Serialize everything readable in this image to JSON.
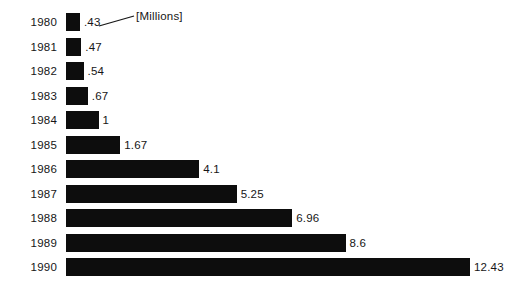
{
  "chart_data": {
    "type": "bar",
    "orientation": "horizontal",
    "title": "",
    "subtitle": "",
    "xlabel": "",
    "ylabel": "",
    "unit_annotation": "[Millions]",
    "categories": [
      "1980",
      "1981",
      "1982",
      "1983",
      "1984",
      "1985",
      "1986",
      "1987",
      "1988",
      "1989",
      "1990"
    ],
    "values": [
      0.43,
      0.47,
      0.54,
      0.67,
      1,
      1.67,
      4.1,
      5.25,
      6.96,
      8.6,
      12.43
    ],
    "value_labels": [
      ".43",
      ".47",
      ".54",
      ".67",
      "1",
      "1.67",
      "4.1",
      "5.25",
      "6.96",
      "8.6",
      "12.43"
    ],
    "xlim": [
      0,
      12.43
    ],
    "grid": false,
    "legend": false,
    "bar_color": "#0d0d0d",
    "background_color": "#ffffff",
    "text_color": "#161616"
  },
  "annotation": {
    "label": "[Millions]",
    "leader_line": {
      "x1": 99,
      "y1": 26,
      "x2": 134,
      "y2": 16
    }
  },
  "layout": {
    "bar_origin_x": 66,
    "px_per_unit": 32.5,
    "row_pitch": 24.5,
    "first_row_top": 13,
    "bar_height": 18,
    "label_gap": 4
  }
}
